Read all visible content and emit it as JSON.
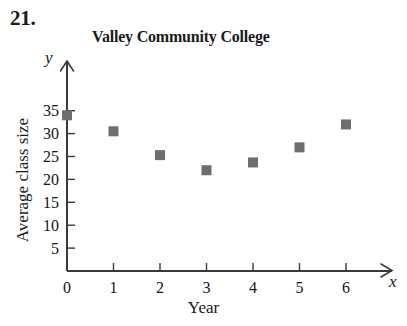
{
  "problem": {
    "number": "21."
  },
  "axis_letters": {
    "y": "y",
    "x": "x"
  },
  "chart_data": {
    "type": "scatter",
    "title": "Valley Community College",
    "xlabel": "Year",
    "ylabel": "Average class size",
    "x": [
      0,
      1,
      2,
      3,
      4,
      5,
      6
    ],
    "values": [
      34,
      30.5,
      25.3,
      22,
      23.7,
      27,
      32
    ],
    "series": [
      {
        "name": "Average class size",
        "values": [
          34,
          30.5,
          25.3,
          22,
          23.7,
          27,
          32
        ]
      }
    ],
    "xtick_labels": [
      "0",
      "1",
      "2",
      "3",
      "4",
      "5",
      "6"
    ],
    "ytick_labels": [
      "5",
      "10",
      "15",
      "20",
      "25",
      "30",
      "35"
    ],
    "xticks": [
      0,
      1,
      2,
      3,
      4,
      5,
      6
    ],
    "yticks": [
      5,
      10,
      15,
      20,
      25,
      30,
      35
    ],
    "xlim": [
      0,
      6.6
    ],
    "ylim": [
      0,
      37
    ],
    "grid": false,
    "legend": false,
    "marker": "square",
    "marker_color": "#6e6e6e",
    "axis_color": "#3a3a3a"
  }
}
